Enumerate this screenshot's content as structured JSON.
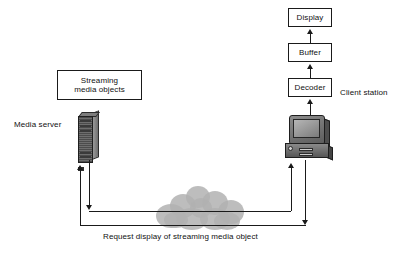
{
  "diagram": {
    "colors": {
      "stroke": "#1a1a1a",
      "text": "#111111",
      "background": "#ffffff",
      "cloud": "#b2b2b2",
      "device_dark": "#4c4c4c",
      "device_light": "#9a9a9a"
    },
    "boxes": [
      {
        "id": "display",
        "label": "Display"
      },
      {
        "id": "buffer",
        "label": "Buffer"
      },
      {
        "id": "decoder",
        "label": "Decoder"
      },
      {
        "id": "streaming_media_objects",
        "label": "Streaming\nmedia objects"
      }
    ],
    "labels": {
      "media_server": "Media server",
      "client_station": "Client station",
      "request_caption": "Request display of streaming media object"
    },
    "icons": {
      "server": "server-tower-icon",
      "client": "desktop-computer-icon",
      "network": "network-cloud-icon"
    },
    "flows": [
      {
        "id": "decoder-to-buffer",
        "from": "Decoder",
        "to": "Buffer",
        "direction": "up"
      },
      {
        "id": "buffer-to-display",
        "from": "Buffer",
        "to": "Display",
        "direction": "up"
      },
      {
        "id": "client-to-decoder",
        "from": "Client station",
        "to": "Decoder",
        "direction": "up"
      },
      {
        "id": "server-to-network",
        "from": "Media server",
        "to": "Network",
        "direction": "down"
      },
      {
        "id": "network-to-client",
        "from": "Network",
        "to": "Client station",
        "direction": "up"
      },
      {
        "id": "client-request-out",
        "from": "Client station",
        "to": "Request path",
        "direction": "down"
      },
      {
        "id": "request-to-server",
        "from": "Request path",
        "to": "Media server",
        "direction": "up"
      }
    ]
  }
}
